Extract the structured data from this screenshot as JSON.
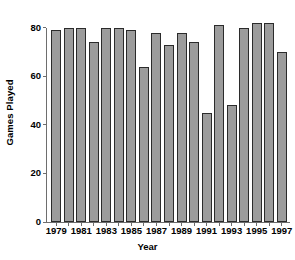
{
  "chart_data": {
    "type": "bar",
    "title": "",
    "subtitle": "",
    "xlabel": "Year",
    "ylabel": "Games Played",
    "categories": [
      "1979",
      "1980",
      "1981",
      "1982",
      "1983",
      "1984",
      "1985",
      "1986",
      "1987",
      "1988",
      "1989",
      "1990",
      "1991",
      "1992",
      "1993",
      "1994",
      "1995",
      "1996",
      "1997"
    ],
    "values": [
      79,
      80,
      80,
      74,
      80,
      80,
      79,
      64,
      78,
      73,
      78,
      74,
      45,
      81,
      48,
      80,
      82,
      82,
      70
    ],
    "series": [
      {
        "name": "Games Played",
        "values": [
          79,
          80,
          80,
          74,
          80,
          80,
          79,
          64,
          78,
          73,
          78,
          74,
          45,
          81,
          48,
          80,
          82,
          82,
          70
        ]
      }
    ],
    "ylim": [
      0,
      84
    ],
    "xlim_categories": 19,
    "y_ticks": [
      0,
      20,
      40,
      60,
      80
    ],
    "y_tick_labels": [
      "0",
      "20",
      "40",
      "60",
      "80"
    ],
    "x_tick_labels": [
      "1979",
      "1981",
      "1983",
      "1985",
      "1987",
      "1989",
      "1991",
      "1993",
      "1995",
      "1997"
    ],
    "x_tick_category_index": [
      0,
      2,
      4,
      6,
      8,
      10,
      12,
      14,
      16,
      18
    ],
    "grid": false,
    "legend": false,
    "legend_position": "none",
    "bar_fill_color": "#9c9c9c",
    "bar_edge_color": "#2b2b2b",
    "axis_color": "#6e6e6e",
    "background_color": "#ffffff",
    "annotations": []
  }
}
